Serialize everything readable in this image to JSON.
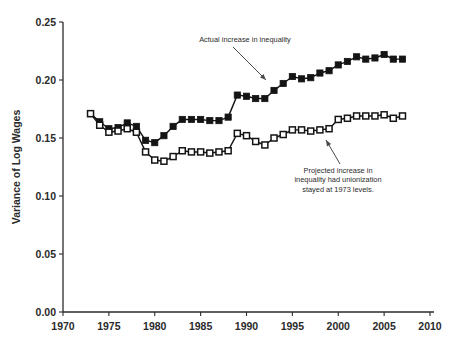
{
  "chart_data": {
    "type": "line",
    "title": "",
    "xlabel": "",
    "ylabel": "Variance of Log Wages",
    "xlim": [
      1970,
      2010
    ],
    "ylim": [
      0.0,
      0.25
    ],
    "xticks": [
      1970,
      1975,
      1980,
      1985,
      1990,
      1995,
      2000,
      2005,
      2010
    ],
    "xtick_labels": [
      "1970",
      "1975",
      "1980",
      "1985",
      "1990",
      "1995",
      "2000",
      "2005",
      "2010"
    ],
    "yticks": [
      0.0,
      0.05,
      0.1,
      0.15,
      0.2,
      0.25
    ],
    "ytick_labels": [
      "0.00",
      "0.05",
      "0.10",
      "0.15",
      "0.20",
      "0.25"
    ],
    "grid": false,
    "legend": "none",
    "x": [
      1973,
      1974,
      1975,
      1976,
      1977,
      1978,
      1979,
      1980,
      1981,
      1982,
      1983,
      1984,
      1985,
      1986,
      1987,
      1988,
      1989,
      1990,
      1991,
      1992,
      1993,
      1994,
      1995,
      1996,
      1997,
      1998,
      1999,
      2000,
      2001,
      2002,
      2003,
      2004,
      2005,
      2006,
      2007
    ],
    "series": [
      {
        "name": "Actual increase in inequality",
        "marker": "filled-square",
        "color": "#141414",
        "values": [
          0.171,
          0.164,
          0.158,
          0.159,
          0.163,
          0.16,
          0.148,
          0.146,
          0.152,
          0.16,
          0.166,
          0.166,
          0.166,
          0.165,
          0.165,
          0.168,
          0.187,
          0.186,
          0.184,
          0.184,
          0.191,
          0.197,
          0.203,
          0.201,
          0.202,
          0.206,
          0.208,
          0.213,
          0.216,
          0.22,
          0.218,
          0.219,
          0.222,
          0.218,
          0.218
        ]
      },
      {
        "name": "Projected increase in inequality had unionization stayed at 1973 levels.",
        "marker": "open-square",
        "color": "#141414",
        "values": [
          0.171,
          0.161,
          0.155,
          0.156,
          0.158,
          0.155,
          0.138,
          0.131,
          0.13,
          0.134,
          0.139,
          0.138,
          0.138,
          0.137,
          0.138,
          0.139,
          0.154,
          0.152,
          0.147,
          0.144,
          0.15,
          0.153,
          0.157,
          0.157,
          0.156,
          0.157,
          0.158,
          0.166,
          0.167,
          0.169,
          0.169,
          0.169,
          0.17,
          0.167,
          0.169
        ]
      }
    ],
    "annotations": [
      {
        "id": "actual-annotation",
        "lines": [
          "Actual increase in inequality"
        ],
        "text_x": 245,
        "text_y": 42,
        "arrow_from_x": 233,
        "arrow_from_y": 47,
        "arrow_to_x": 266,
        "arrow_to_y": 80
      },
      {
        "id": "projected-annotation",
        "lines": [
          "Projected increase in",
          "inequality had unionization",
          "stayed at 1973 levels."
        ],
        "text_x": 338,
        "text_y": 173,
        "arrow_from_x": 340,
        "arrow_from_y": 164,
        "arrow_to_x": 326,
        "arrow_to_y": 140
      }
    ]
  },
  "axes": {
    "y_axis_title": "Variance of Log Wages"
  }
}
